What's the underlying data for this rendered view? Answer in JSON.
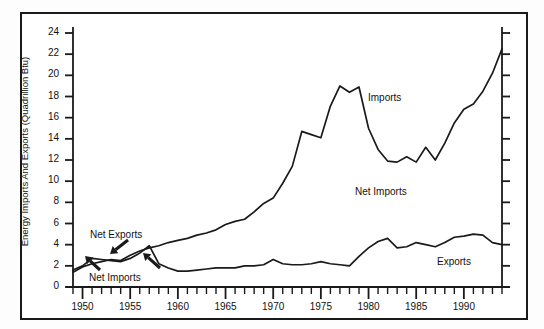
{
  "chart_data": {
    "type": "line",
    "title": "",
    "xlabel": "",
    "ylabel": "Energy Imports And Exports (Quadrillion Btu)",
    "xlim": [
      1949,
      1994
    ],
    "ylim": [
      0,
      24
    ],
    "ytick_step": 2,
    "ytick_labels": [
      "0",
      "2",
      "4",
      "6",
      "8",
      "10",
      "12",
      "14",
      "16",
      "18",
      "20",
      "22",
      "24"
    ],
    "xtick_labels": [
      "1950",
      "1955",
      "1960",
      "1965",
      "1970",
      "1975",
      "1980",
      "1985",
      "1990"
    ],
    "xtick_values": [
      1950,
      1955,
      1960,
      1965,
      1970,
      1975,
      1980,
      1985,
      1990
    ],
    "x_minor_tick_interval": 1,
    "grid": false,
    "legend": "inline-labels",
    "line_color": "#1a1a1a",
    "series": [
      {
        "name": "Imports",
        "x": [
          1949,
          1950,
          1951,
          1952,
          1953,
          1954,
          1955,
          1956,
          1957,
          1958,
          1959,
          1960,
          1961,
          1962,
          1963,
          1964,
          1965,
          1966,
          1967,
          1968,
          1969,
          1970,
          1971,
          1972,
          1973,
          1974,
          1975,
          1976,
          1977,
          1978,
          1979,
          1980,
          1981,
          1982,
          1983,
          1984,
          1985,
          1986,
          1987,
          1988,
          1989,
          1990,
          1991,
          1992,
          1993,
          1994
        ],
        "values": [
          1.4,
          1.9,
          2.2,
          2.4,
          2.6,
          2.5,
          3.0,
          3.4,
          3.7,
          3.9,
          4.2,
          4.4,
          4.6,
          4.9,
          5.1,
          5.4,
          5.9,
          6.2,
          6.4,
          7.1,
          7.9,
          8.4,
          9.8,
          11.4,
          14.7,
          14.4,
          14.1,
          17.1,
          19.0,
          18.4,
          18.9,
          15.0,
          13.0,
          11.9,
          11.8,
          12.3,
          11.8,
          13.2,
          12.0,
          13.6,
          15.5,
          16.8,
          17.3,
          18.5,
          20.2,
          22.5
        ]
      },
      {
        "name": "Exports",
        "x": [
          1949,
          1950,
          1951,
          1952,
          1953,
          1954,
          1955,
          1956,
          1957,
          1958,
          1959,
          1960,
          1961,
          1962,
          1963,
          1964,
          1965,
          1966,
          1967,
          1968,
          1969,
          1970,
          1971,
          1972,
          1973,
          1974,
          1975,
          1976,
          1977,
          1978,
          1979,
          1980,
          1981,
          1982,
          1983,
          1984,
          1985,
          1986,
          1987,
          1988,
          1989,
          1990,
          1991,
          1992,
          1993,
          1994
        ],
        "values": [
          1.6,
          2.0,
          2.7,
          2.6,
          2.5,
          2.4,
          2.7,
          3.2,
          3.9,
          2.2,
          1.8,
          1.5,
          1.5,
          1.6,
          1.7,
          1.8,
          1.8,
          1.8,
          2.0,
          2.0,
          2.1,
          2.6,
          2.2,
          2.1,
          2.1,
          2.2,
          2.4,
          2.2,
          2.1,
          2.0,
          2.9,
          3.7,
          4.3,
          4.6,
          3.7,
          3.8,
          4.2,
          4.0,
          3.8,
          4.2,
          4.7,
          4.8,
          5.0,
          4.9,
          4.2,
          4.0
        ]
      }
    ],
    "annotations": [
      {
        "text": "Net Exports",
        "role": "arrow-callout",
        "points_to": "early-crossover-upper"
      },
      {
        "text": "Net Imports",
        "role": "arrow-callout",
        "points_to": "early-crossover-lower"
      },
      {
        "text": "Net Imports",
        "role": "region-label",
        "points_to": "gap-between-curves"
      },
      {
        "text": "Imports",
        "role": "series-label",
        "points_to": "imports-line"
      },
      {
        "text": "Exports",
        "role": "series-label",
        "points_to": "exports-line"
      }
    ]
  }
}
